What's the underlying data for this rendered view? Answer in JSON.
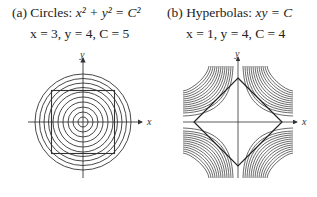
{
  "panels": [
    {
      "id": "a",
      "label": "(a)",
      "name": "Circles:",
      "equation": "x² + y² = C²",
      "params": "x = 3, y = 4, C = 5",
      "axes": {
        "x": "x",
        "y": "y"
      },
      "curves": "concentric circles",
      "circle_count": 10,
      "overlay": "square"
    },
    {
      "id": "b",
      "label": "(b)",
      "name": "Hyperbolas:",
      "equation": "xy = C",
      "params": "x = 1, y = 4, C = 4",
      "axes": {
        "x": "x",
        "y": "y"
      },
      "curves": "families of hyperbolas in four quadrants",
      "overlay": "diamond"
    }
  ]
}
